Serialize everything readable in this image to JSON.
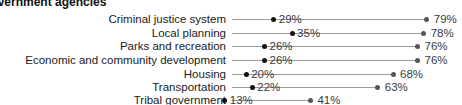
{
  "chart_data": {
    "type": "dumbbell",
    "title": "Government agencies",
    "categories": [
      "Criminal justice system",
      "Local planning",
      "Parks and recreation",
      "Economic and community development",
      "Housing",
      "Transportation",
      "Tribal government"
    ],
    "series": [
      {
        "name": "Low",
        "color": "#111111",
        "values": [
          29,
          35,
          26,
          26,
          20,
          22,
          13
        ],
        "labels": [
          "29%",
          "35%",
          "26%",
          "26%",
          "20%",
          "22%",
          "13%"
        ]
      },
      {
        "name": "High",
        "color": "#555555",
        "values": [
          79,
          78,
          76,
          76,
          68,
          63,
          41
        ],
        "labels": [
          "79%",
          "78%",
          "76%",
          "76%",
          "68%",
          "63%",
          "41%"
        ]
      }
    ],
    "xlabel": "",
    "ylabel": "",
    "xlim": [
      0,
      100
    ],
    "grid": false,
    "legend": "none"
  }
}
